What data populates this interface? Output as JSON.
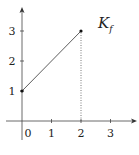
{
  "chart_data": {
    "type": "line",
    "title": "",
    "xlabel": "",
    "ylabel": "",
    "xlim": [
      -0.1,
      3.8
    ],
    "ylim": [
      -0.3,
      3.8
    ],
    "x_ticks": [
      0,
      1,
      2,
      3
    ],
    "x_tick_labels": [
      "0",
      "1",
      "2",
      "3"
    ],
    "y_ticks": [
      1,
      2,
      3
    ],
    "y_tick_labels": [
      "1",
      "2",
      "3"
    ],
    "grid": false,
    "series": [
      {
        "name": "K_f",
        "label_main": "K",
        "label_sub": "f",
        "x": [
          0,
          2
        ],
        "y": [
          1,
          3
        ],
        "endpoint_markers": true
      }
    ],
    "annotations": [
      {
        "type": "dotted-vertical-line",
        "x": 2,
        "from_y": 0,
        "to_y": 3
      }
    ]
  }
}
